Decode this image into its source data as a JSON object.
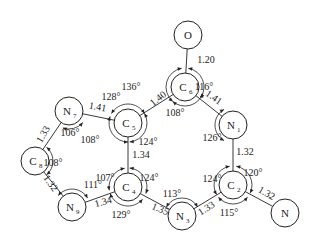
{
  "atoms": [
    {
      "id": "O",
      "symbol": "O",
      "sub": ""
    },
    {
      "id": "C6",
      "symbol": "C",
      "sub": "6"
    },
    {
      "id": "N7",
      "symbol": "N",
      "sub": "7"
    },
    {
      "id": "C5",
      "symbol": "C",
      "sub": "5"
    },
    {
      "id": "N1",
      "symbol": "N",
      "sub": "1"
    },
    {
      "id": "C8",
      "symbol": "C",
      "sub": "8"
    },
    {
      "id": "C4",
      "symbol": "C",
      "sub": "4"
    },
    {
      "id": "C2",
      "symbol": "C",
      "sub": "2"
    },
    {
      "id": "N9",
      "symbol": "N",
      "sub": "9"
    },
    {
      "id": "N3",
      "symbol": "N",
      "sub": "3"
    },
    {
      "id": "N",
      "symbol": "N",
      "sub": ""
    }
  ],
  "bonds": [
    {
      "a": "O",
      "b": "C6",
      "length": "1.20"
    },
    {
      "a": "C6",
      "b": "C5",
      "length": "1.40"
    },
    {
      "a": "C6",
      "b": "N1",
      "length": "1.41"
    },
    {
      "a": "N7",
      "b": "C5",
      "length": "1.41"
    },
    {
      "a": "N7",
      "b": "C8",
      "length": "1.33"
    },
    {
      "a": "C8",
      "b": "N9",
      "length": "1.32"
    },
    {
      "a": "N9",
      "b": "C4",
      "length": "1.34"
    },
    {
      "a": "C5",
      "b": "C4",
      "length": "1.34"
    },
    {
      "a": "C4",
      "b": "N3",
      "length": "1.35"
    },
    {
      "a": "N3",
      "b": "C2",
      "length": "1.33"
    },
    {
      "a": "N1",
      "b": "C2",
      "length": "1.32"
    },
    {
      "a": "C2",
      "b": "N",
      "length": "1.32"
    }
  ],
  "angles": [
    {
      "atom": "C6",
      "label": "136°"
    },
    {
      "atom": "C6",
      "label": "116°"
    },
    {
      "atom": "C6",
      "label": "108°"
    },
    {
      "atom": "C5",
      "label": "128°"
    },
    {
      "atom": "C5",
      "label": "108°"
    },
    {
      "atom": "C5",
      "label": "124°"
    },
    {
      "atom": "N7",
      "label": "106°"
    },
    {
      "atom": "N1",
      "label": "126°"
    },
    {
      "atom": "C8",
      "label": "108°"
    },
    {
      "atom": "C4",
      "label": "107°"
    },
    {
      "atom": "C4",
      "label": "124°"
    },
    {
      "atom": "C4",
      "label": "129°"
    },
    {
      "atom": "N9",
      "label": "111°"
    },
    {
      "atom": "N3",
      "label": "113°"
    },
    {
      "atom": "C2",
      "label": "124°"
    },
    {
      "atom": "C2",
      "label": "120°"
    },
    {
      "atom": "C2",
      "label": "115°"
    }
  ]
}
